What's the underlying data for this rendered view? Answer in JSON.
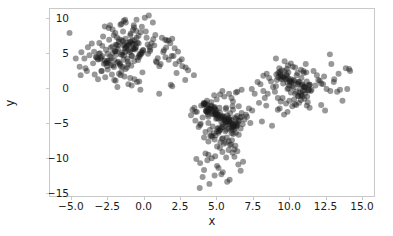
{
  "figure": {
    "background_color": "#ffffff",
    "frame_color": "#c9c9c9",
    "xlabel": "x",
    "ylabel": "y"
  },
  "chart_data": {
    "type": "scatter",
    "title": "",
    "xlabel": "x",
    "ylabel": "y",
    "xlim": [
      -6.5,
      15.9
    ],
    "ylim": [
      -15.6,
      11.4
    ],
    "xticks": [
      -5.0,
      -2.5,
      0.0,
      2.5,
      5.0,
      7.5,
      10.0,
      12.5,
      15.0
    ],
    "xtick_labels": [
      "-5.0",
      "-2.5",
      "0.0",
      "2.5",
      "5.0",
      "7.5",
      "10.0",
      "12.5",
      "15.0"
    ],
    "yticks": [
      10,
      5,
      0,
      -5,
      -10,
      -15
    ],
    "ytick_labels": [
      "10",
      "5",
      "0",
      "-5",
      "-10",
      "-15"
    ],
    "grid": false,
    "legend": false,
    "marker": "circle",
    "marker_size": 3.0,
    "marker_color": "#1a1a1a",
    "marker_alpha": 0.45,
    "n_points": 600,
    "clusters": [
      {
        "name": "cluster-top-left",
        "center": [
          -1.4,
          4.6
        ],
        "spread": [
          1.5,
          1.8
        ],
        "n": 200
      },
      {
        "name": "cluster-bottom-middle",
        "center": [
          5.3,
          -4.3
        ],
        "spread": [
          1.3,
          2.6
        ],
        "n": 200
      },
      {
        "name": "cluster-right",
        "center": [
          10.3,
          0.6
        ],
        "spread": [
          1.4,
          1.1
        ],
        "n": 200
      }
    ],
    "series": [
      {
        "name": "points",
        "x": [
          -1.52,
          -0.37,
          -1.93,
          -2.41,
          -0.72,
          -1.15,
          -2.88,
          -0.05,
          -1.68,
          -3.12,
          -0.94,
          -1.31,
          -2.05,
          -0.58,
          -1.77,
          -2.63,
          -0.21,
          -1.44,
          -3.45,
          -1.09,
          -0.83,
          -2.19,
          -1.62,
          -0.46,
          -2.97,
          -1.25,
          -0.68,
          -1.88,
          -2.34,
          -0.12,
          -1.55,
          -3.01,
          -0.91,
          -2.47,
          -1.18,
          -0.34,
          -1.99,
          -2.72,
          -0.77,
          -1.41,
          -0.55,
          -2.13,
          -1.74,
          -3.28,
          -0.99,
          -1.36,
          -2.58,
          -0.28,
          -1.81,
          -1.07,
          -2.25,
          -0.63,
          -1.49,
          -3.09,
          -0.86,
          -2.01,
          -1.29,
          -0.41,
          -1.95,
          -2.78,
          -0.74,
          -1.58,
          -2.41,
          -0.18,
          -1.12,
          -3.33,
          -0.96,
          -2.16,
          -1.67,
          -0.51,
          -2.89,
          -1.23,
          -0.79,
          -1.85,
          -2.52,
          -0.07,
          -1.46,
          -3.17,
          -0.88,
          -2.31,
          -1.14,
          -0.44,
          -1.91,
          -2.66,
          -0.81,
          -1.38,
          -0.61,
          -2.08,
          -1.72,
          -3.21,
          -1.03,
          -1.33,
          -2.55,
          -0.31,
          -1.79,
          -1.11,
          -2.28,
          -0.67,
          -1.51,
          -3.05,
          0.28,
          0.71,
          1.15,
          0.44,
          0.95,
          1.58,
          0.18,
          0.82,
          1.33,
          0.52,
          1.91,
          0.37,
          1.06,
          0.64,
          1.48,
          2.12,
          0.25,
          0.88,
          1.71,
          0.41,
          -4.12,
          -3.88,
          -4.45,
          -3.61,
          -4.05,
          -3.77,
          -4.33,
          -3.52,
          -2.95,
          -3.41,
          -1.45,
          -0.92,
          -2.17,
          -1.63,
          -0.38,
          -2.71,
          -1.26,
          -0.55,
          -1.98,
          -2.44,
          -1.31,
          -0.77,
          -2.09,
          -1.56,
          -0.24,
          -2.83,
          -1.41,
          -0.69,
          -1.87,
          -2.35,
          -0.11,
          -1.62,
          -2.51,
          -0.95,
          -1.19,
          -2.06,
          -1.73,
          -0.48,
          -1.35,
          -2.92,
          -1.08,
          -0.66,
          -1.84,
          -2.22,
          -0.33,
          -1.57,
          -2.68,
          -0.85,
          -1.27,
          -1.96,
          0.05,
          0.61,
          -0.15,
          1.24,
          0.33,
          -0.52,
          0.78,
          1.47,
          0.12,
          -0.71,
          2.35,
          1.82,
          2.61,
          1.95,
          2.18,
          1.53,
          2.88,
          1.71,
          2.04,
          1.38,
          -5.15,
          -4.72,
          -3.95,
          -4.38,
          -2.55,
          -3.18,
          -0.95,
          -0.25,
          1.05,
          1.85,
          5.35,
          4.82,
          5.91,
          4.45,
          6.12,
          5.08,
          4.28,
          6.41,
          5.62,
          4.95,
          5.21,
          6.03,
          4.61,
          5.78,
          4.38,
          6.25,
          5.45,
          4.75,
          5.95,
          6.52,
          4.15,
          5.68,
          4.92,
          6.18,
          5.31,
          4.52,
          6.35,
          5.05,
          4.68,
          5.85,
          6.08,
          4.41,
          5.52,
          4.88,
          6.45,
          5.15,
          4.25,
          5.72,
          6.22,
          4.98,
          5.41,
          4.62,
          6.15,
          5.88,
          4.35,
          5.25,
          6.58,
          4.85,
          5.62,
          4.48,
          6.28,
          5.08,
          4.72,
          5.98,
          4.18,
          6.38,
          5.55,
          4.92,
          5.18,
          6.05,
          4.55,
          5.78,
          6.45,
          4.28,
          5.35,
          4.98,
          6.12,
          5.68,
          4.42,
          5.88,
          3.65,
          3.92,
          3.48,
          4.05,
          3.78,
          3.25,
          4.12,
          3.55,
          3.88,
          3.35,
          7.05,
          6.82,
          7.25,
          6.95,
          7.48,
          6.68,
          7.12,
          6.55,
          7.35,
          6.75,
          5.45,
          4.95,
          5.85,
          5.15,
          6.02,
          4.72,
          5.62,
          5.28,
          4.88,
          6.18,
          5.05,
          5.72,
          4.58,
          6.25,
          5.38,
          4.82,
          5.95,
          6.45,
          4.45,
          5.52,
          4.25,
          6.08,
          5.25,
          4.92,
          5.65,
          6.32,
          4.68,
          5.42,
          5.85,
          4.38,
          3.88,
          4.45,
          5.05,
          5.68,
          6.25,
          6.85,
          4.15,
          5.35,
          6.52,
          3.62,
          4.05,
          5.15,
          5.92,
          6.68,
          4.52,
          5.45,
          6.12,
          3.85,
          4.88,
          5.75,
          4.35,
          5.25,
          6.05,
          4.65,
          5.55,
          3.95,
          6.35,
          5.02,
          4.25,
          5.88,
          3.55,
          4.12,
          4.85,
          5.42,
          6.15,
          6.75,
          5.68,
          4.45,
          5.15,
          6.45,
          10.25,
          9.82,
          10.91,
          9.45,
          11.12,
          10.08,
          9.28,
          11.41,
          10.62,
          9.95,
          10.15,
          11.03,
          9.61,
          10.78,
          9.38,
          11.25,
          10.45,
          9.75,
          10.95,
          11.52,
          9.15,
          10.68,
          9.92,
          11.18,
          10.31,
          9.52,
          11.35,
          10.05,
          9.68,
          10.85,
          11.08,
          9.41,
          10.52,
          9.88,
          11.45,
          10.15,
          9.25,
          10.72,
          11.22,
          9.98,
          10.41,
          9.62,
          11.15,
          10.88,
          9.35,
          10.25,
          11.58,
          9.85,
          10.62,
          9.48,
          11.28,
          10.08,
          9.72,
          10.98,
          9.18,
          11.38,
          10.55,
          9.92,
          10.18,
          11.05,
          9.55,
          10.78,
          11.45,
          9.28,
          10.35,
          9.98,
          11.12,
          10.68,
          9.42,
          10.88,
          8.65,
          8.92,
          8.48,
          9.05,
          8.78,
          8.25,
          9.12,
          8.55,
          12.05,
          12.38,
          12.62,
          11.95,
          12.25,
          11.72,
          12.88,
          12.15,
          11.85,
          12.45,
          13.12,
          13.55,
          10.45,
          9.95,
          10.85,
          10.15,
          11.02,
          9.72,
          10.62,
          10.28,
          9.88,
          11.18,
          10.05,
          10.72,
          9.58,
          11.25,
          10.38,
          9.82,
          10.95,
          11.45,
          9.45,
          10.52,
          9.25,
          11.08,
          10.25,
          9.92,
          10.65,
          11.32,
          9.68,
          10.42,
          10.85,
          9.38,
          8.15,
          8.85,
          13.95,
          14.25,
          12.85,
          13.35,
          8.35,
          7.95,
          12.52,
          13.72,
          7.65,
          8.45,
          14.05,
          13.15,
          12.95,
          8.05,
          9.12,
          13.45,
          14.18,
          12.25,
          2.45,
          3.05,
          2.85,
          1.95,
          2.25,
          7.85,
          8.25,
          3.45,
          2.65,
          7.45,
          5.15,
          5.85,
          4.65,
          6.35,
          4.35,
          6.75,
          5.45,
          4.95,
          6.05,
          5.65,
          4.45,
          5.25,
          6.55,
          5.05,
          4.75,
          6.15,
          5.35,
          4.25,
          5.95,
          6.45,
          4.85,
          5.55,
          4.15,
          6.25,
          5.75,
          4.55,
          6.65,
          5.15,
          4.35,
          5.85,
          6.05,
          4.95,
          5.45,
          6.35,
          4.65,
          5.25,
          5.65,
          4.45,
          6.15,
          5.05
        ],
        "y": [
          5.12,
          6.45,
          4.78,
          3.92,
          5.65,
          4.25,
          6.08,
          5.41,
          3.55,
          4.95,
          6.72,
          5.18,
          4.02,
          6.35,
          3.78,
          5.52,
          4.88,
          6.15,
          5.25,
          3.45,
          4.62,
          5.98,
          3.15,
          6.52,
          4.35,
          5.75,
          3.88,
          6.22,
          4.55,
          5.08,
          6.88,
          4.18,
          5.45,
          3.62,
          6.05,
          4.72,
          5.32,
          3.95,
          6.42,
          4.08,
          5.88,
          3.25,
          6.65,
          4.45,
          5.15,
          6.32,
          3.72,
          4.92,
          5.58,
          6.18,
          4.28,
          5.72,
          3.05,
          6.48,
          4.65,
          5.35,
          7.12,
          4.02,
          6.25,
          3.48,
          5.62,
          4.82,
          6.95,
          5.22,
          3.82,
          4.48,
          6.62,
          5.05,
          3.38,
          7.25,
          4.58,
          5.92,
          6.38,
          3.68,
          4.95,
          5.48,
          6.78,
          4.12,
          3.22,
          5.82,
          6.52,
          4.38,
          5.28,
          3.58,
          6.85,
          4.68,
          5.55,
          3.02,
          7.05,
          4.22,
          6.28,
          5.68,
          3.92,
          4.52,
          6.12,
          5.38,
          3.32,
          6.92,
          4.78,
          5.02,
          4.95,
          6.15,
          3.45,
          5.62,
          4.28,
          6.85,
          7.25,
          3.85,
          5.18,
          6.45,
          4.62,
          5.92,
          3.15,
          7.05,
          4.45,
          5.75,
          6.28,
          3.68,
          4.08,
          5.35,
          4.25,
          5.88,
          3.05,
          6.42,
          2.85,
          4.72,
          5.15,
          3.55,
          2.45,
          1.95,
          8.15,
          7.85,
          8.45,
          9.12,
          7.55,
          8.88,
          9.45,
          8.25,
          7.95,
          8.65,
          9.85,
          8.38,
          7.62,
          9.25,
          8.05,
          7.42,
          9.68,
          8.72,
          7.28,
          9.05,
          2.25,
          1.85,
          2.65,
          1.45,
          2.95,
          1.15,
          2.05,
          0.85,
          1.65,
          2.45,
          0.55,
          1.25,
          0.15,
          1.95,
          0.95,
          2.35,
          1.55,
          0.35,
          2.75,
          1.05,
          10.15,
          9.45,
          8.85,
          7.25,
          10.45,
          9.85,
          7.65,
          6.95,
          8.15,
          9.05,
          5.25,
          6.45,
          4.15,
          7.12,
          3.45,
          5.85,
          2.95,
          6.85,
          4.62,
          5.45,
          7.95,
          4.25,
          2.45,
          1.85,
          3.15,
          1.25,
          7.62,
          -0.25,
          -0.85,
          0.45,
          -4.25,
          -3.85,
          -4.62,
          -3.45,
          -5.15,
          -4.05,
          -3.25,
          -5.45,
          -4.85,
          -3.72,
          -2.85,
          -5.72,
          -3.05,
          -4.45,
          -2.45,
          -5.95,
          -4.15,
          -3.55,
          -5.25,
          -4.72,
          -2.25,
          -4.95,
          -3.15,
          -5.62,
          -4.38,
          -2.95,
          -5.08,
          -3.65,
          -2.62,
          -4.28,
          -5.85,
          -3.35,
          -4.55,
          -2.75,
          -5.35,
          -3.95,
          -2.15,
          -4.82,
          -5.55,
          -3.25,
          -4.05,
          -2.55,
          -5.18,
          -4.45,
          -3.45,
          -6.12,
          -4.72,
          -2.85,
          -5.45,
          -3.05,
          -4.25,
          -5.88,
          -3.75,
          -4.95,
          -2.35,
          -5.62,
          -4.15,
          -3.55,
          -6.25,
          -4.62,
          -2.95,
          -5.25,
          -4.05,
          -3.35,
          -5.75,
          -4.45,
          -2.65,
          -6.05,
          -3.85,
          -4.88,
          -3.45,
          -5.15,
          -2.85,
          -4.25,
          -5.65,
          -3.95,
          -2.45,
          -4.72,
          -5.35,
          -3.15,
          -3.85,
          -5.25,
          -2.95,
          -4.55,
          -3.25,
          -5.85,
          -4.15,
          -2.65,
          -5.05,
          -3.62,
          -7.25,
          -6.85,
          -7.65,
          -6.45,
          -8.15,
          -7.05,
          -6.25,
          -7.85,
          -7.45,
          -6.65,
          -8.45,
          -7.15,
          -6.95,
          -8.85,
          -7.35,
          -6.55,
          -8.25,
          -9.15,
          -7.72,
          -8.05,
          -9.45,
          -7.55,
          -8.65,
          -9.85,
          -7.88,
          -8.35,
          -10.15,
          -9.25,
          -8.95,
          -10.45,
          -10.85,
          -9.65,
          -11.25,
          -10.05,
          -9.95,
          -10.65,
          -11.85,
          -12.45,
          -11.05,
          -10.25,
          -12.85,
          -11.55,
          -13.25,
          -11.95,
          -13.85,
          -12.15,
          -9.35,
          -14.45,
          -12.65,
          -13.55,
          -1.85,
          -0.95,
          -1.45,
          -2.05,
          -1.25,
          -2.55,
          -0.65,
          -1.65,
          -2.35,
          -0.85,
          -3.45,
          -2.15,
          -1.05,
          -0.45,
          -1.95,
          -0.25,
          -2.85,
          -3.15,
          -3.85,
          -0.55,
          0.85,
          1.25,
          0.45,
          1.85,
          0.15,
          1.05,
          2.15,
          -0.25,
          0.65,
          1.45,
          -0.65,
          0.25,
          1.65,
          -0.15,
          2.35,
          0.95,
          -0.85,
          1.35,
          0.55,
          -0.45,
          1.95,
          -1.15,
          0.75,
          0.05,
          1.15,
          2.55,
          -0.35,
          0.35,
          1.55,
          -0.95,
          0.15,
          2.05,
          -0.55,
          1.75,
          0.45,
          1.25,
          -1.45,
          0.85,
          2.25,
          -0.05,
          1.05,
          0.65,
          -0.75,
          1.45,
          2.85,
          0.25,
          -0.25,
          1.95,
          0.55,
          1.65,
          -1.25,
          0.95,
          2.45,
          -0.45,
          1.15,
          0.35,
          1.85,
          -0.15,
          0.75,
          2.15,
          1.25,
          -0.65,
          0.45,
          1.55,
          0.05,
          2.25,
          -0.35,
          0.85,
          1.35,
          -1.05,
          1.45,
          0.15,
          2.05,
          -0.55,
          0.95,
          1.75,
          0.25,
          -0.85,
          1.15,
          0.55,
          -0.15,
          1.85,
          0.65,
          2.45,
          -0.45,
          1.05,
          0.35,
          1.65,
          0.85,
          -0.25,
          2.95,
          3.25,
          2.65,
          3.55,
          2.45,
          3.85,
          2.15,
          3.05,
          2.75,
          3.45,
          -1.85,
          -2.15,
          -1.45,
          -2.55,
          -1.65,
          -2.25,
          -1.25,
          -2.85,
          -1.95,
          -2.45,
          -3.15,
          -1.55,
          -2.65,
          -3.45,
          -1.15,
          -2.05,
          -3.85,
          -2.35,
          -1.75,
          -2.95,
          -4.85,
          -5.45,
          2.85,
          2.45,
          4.85,
          -0.55,
          -1.45,
          -2.15,
          -3.25,
          -1.85,
          -0.85,
          -2.55,
          -0.15,
          1.25,
          3.45,
          0.55,
          4.25,
          2.05,
          2.75,
          -2.45,
          3.85,
          2.55,
          1.15,
          0.25,
          2.15,
          0.85,
          -0.45,
          1.85,
          3.15,
          -0.15,
          -4.45,
          -5.85,
          -3.25,
          -6.45,
          -2.85,
          -4.15,
          -5.25,
          -3.85,
          -6.15,
          -4.65,
          -5.05,
          -3.55,
          -6.75,
          -4.35,
          -5.55,
          -3.15,
          -4.95,
          -6.35,
          -3.65,
          -5.15,
          -2.95,
          -4.55,
          -7.15,
          -5.35,
          -3.95,
          -6.05,
          -4.25,
          -5.75,
          -3.45,
          -4.85,
          -6.55,
          -3.75,
          -5.65,
          -4.45,
          -6.85,
          -5.95,
          -3.05,
          -4.15,
          -5.45,
          -6.25
        ]
      }
    ]
  }
}
